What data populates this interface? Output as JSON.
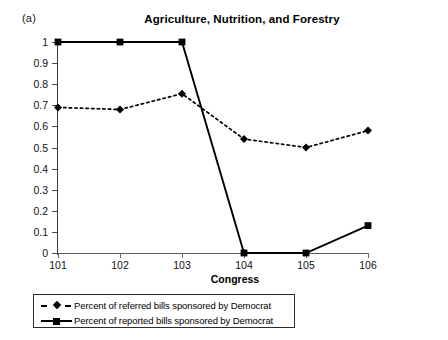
{
  "panel": {
    "label": "(a)"
  },
  "chart_data": {
    "type": "line",
    "title": "Agriculture, Nutrition, and Forestry",
    "xlabel": "Congress",
    "ylabel": "",
    "categories": [
      "101",
      "102",
      "103",
      "104",
      "105",
      "106"
    ],
    "x_ticklabels": [
      "101",
      "102",
      "103",
      "104",
      "105",
      "106"
    ],
    "y_ticklabels": [
      "0",
      "0.1",
      "0.2",
      "0.3",
      "0.4",
      "0.5",
      "0.6",
      "0.7",
      "0.8",
      "0.9",
      "1"
    ],
    "y_tickvalues": [
      0,
      0.1,
      0.2,
      0.3,
      0.4,
      0.5,
      0.6,
      0.7,
      0.8,
      0.9,
      1
    ],
    "ylim": [
      0,
      1
    ],
    "grid": false,
    "legend_position": "below-axes",
    "series": [
      {
        "name": "Percent of referred bills sponsored by Democrat",
        "marker": "diamond",
        "linestyle": "dashed",
        "color": "#000000",
        "values": [
          0.69,
          0.68,
          0.755,
          0.54,
          0.5,
          0.58
        ]
      },
      {
        "name": "Percent of reported bills sponsored by Democrat",
        "marker": "square",
        "linestyle": "solid",
        "color": "#000000",
        "values": [
          1.0,
          1.0,
          1.0,
          0.0,
          0.0,
          0.13
        ]
      }
    ]
  }
}
